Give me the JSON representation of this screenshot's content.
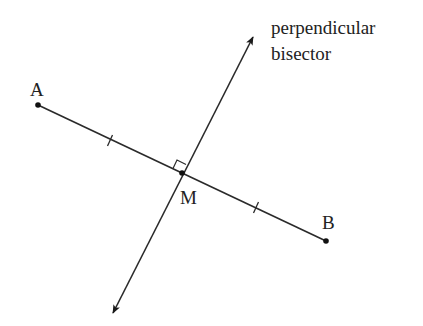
{
  "diagram": {
    "colors": {
      "line": "#2a2a2a",
      "text": "#222222",
      "background": "#ffffff"
    },
    "points": {
      "A": {
        "label": "A",
        "x": 38,
        "y": 105
      },
      "B": {
        "label": "B",
        "x": 326,
        "y": 241
      },
      "M": {
        "label": "M",
        "x": 182,
        "y": 173
      }
    },
    "bisector": {
      "label_line1": "perpendicular",
      "label_line2": "bisector",
      "arrow_top": {
        "x": 253,
        "y": 37
      },
      "arrow_bottom": {
        "x": 113,
        "y": 313
      }
    },
    "marks": {
      "tick_marks": 2,
      "right_angle_at": "M"
    }
  }
}
